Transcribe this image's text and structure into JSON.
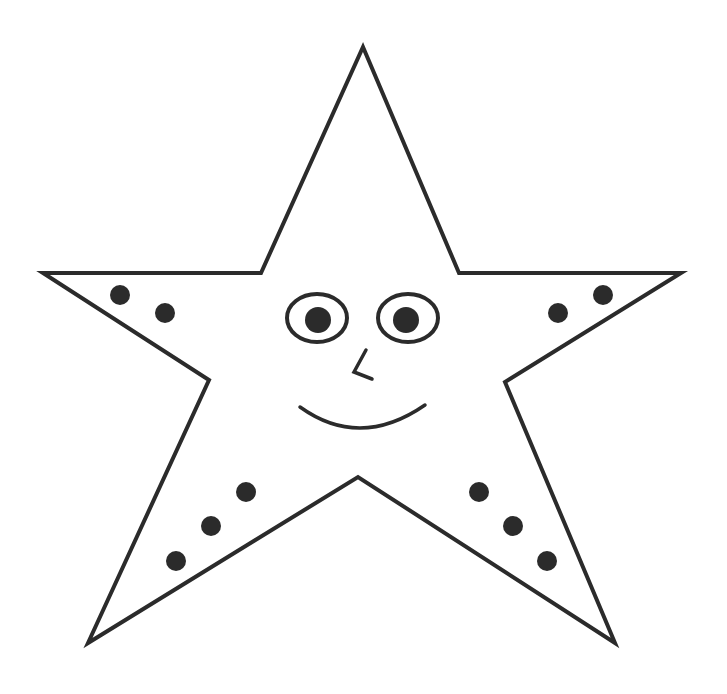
{
  "illustration": {
    "subject": "smiling cartoon star",
    "colors": {
      "background": "#ffffff",
      "stroke": "#2b2b2b",
      "fill": "#2b2b2b"
    },
    "outline_points": "363,47 459,273 681,273 505,382 615,643 358,477 88,643 209,380 43,273 261,273",
    "eyes": [
      {
        "cx": 317,
        "cy": 318,
        "rx": 30,
        "ry": 24,
        "pupil_cx": 318,
        "pupil_cy": 320,
        "pupil_r": 13
      },
      {
        "cx": 408,
        "cy": 318,
        "rx": 30,
        "ry": 24,
        "pupil_cx": 406,
        "pupil_cy": 320,
        "pupil_r": 13
      }
    ],
    "spots": [
      {
        "cx": 120,
        "cy": 295,
        "r": 10
      },
      {
        "cx": 165,
        "cy": 313,
        "r": 10
      },
      {
        "cx": 558,
        "cy": 313,
        "r": 10
      },
      {
        "cx": 603,
        "cy": 295,
        "r": 10
      },
      {
        "cx": 246,
        "cy": 492,
        "r": 10
      },
      {
        "cx": 211,
        "cy": 526,
        "r": 10
      },
      {
        "cx": 176,
        "cy": 561,
        "r": 10
      },
      {
        "cx": 479,
        "cy": 492,
        "r": 10
      },
      {
        "cx": 513,
        "cy": 526,
        "r": 10
      },
      {
        "cx": 547,
        "cy": 561,
        "r": 10
      }
    ]
  }
}
